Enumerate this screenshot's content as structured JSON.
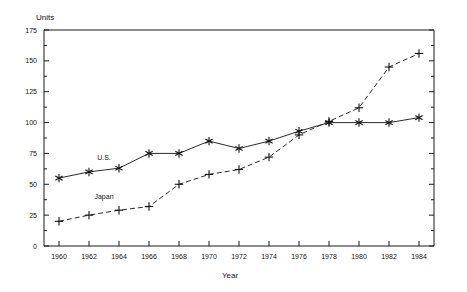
{
  "chart_data": {
    "type": "line",
    "title": "",
    "xlabel": "Year",
    "ylabel": "Units",
    "x": [
      1960,
      1962,
      1964,
      1966,
      1968,
      1970,
      1972,
      1974,
      1976,
      1978,
      1980,
      1982,
      1984
    ],
    "xticklabels": [
      "1960",
      "1962",
      "1964",
      "1966",
      "1968",
      "1970",
      "1972",
      "1974",
      "1976",
      "1978",
      "1980",
      "1982",
      "1984"
    ],
    "yticklabels": [
      "0",
      "25",
      "50",
      "75",
      "100",
      "125",
      "150",
      "175"
    ],
    "yticks": [
      0,
      25,
      50,
      75,
      100,
      125,
      150,
      175
    ],
    "xlim": [
      1959,
      1985
    ],
    "ylim": [
      0,
      175
    ],
    "grid": false,
    "legend_position": "inline-annotations",
    "series": [
      {
        "name": "U.S.",
        "marker": "asterisk",
        "linestyle": "solid",
        "color": "#2b2b2b",
        "values": [
          55,
          60,
          63,
          75,
          75,
          85,
          79,
          85,
          93,
          100,
          100,
          100,
          104
        ]
      },
      {
        "name": "Japan",
        "marker": "plus",
        "linestyle": "dashed",
        "color": "#2b2b2b",
        "values": [
          20,
          25,
          29,
          32,
          50,
          58,
          62,
          72,
          90,
          101,
          112,
          145,
          156
        ]
      }
    ],
    "annotations": [
      {
        "text": "U.S.",
        "x": 1963.0,
        "y": 70
      },
      {
        "text": "Japan",
        "x": 1963.0,
        "y": 38
      }
    ],
    "minor_y_ticks": [
      12.5,
      37.5,
      62.5,
      87.5,
      112.5,
      137.5,
      162.5
    ]
  }
}
